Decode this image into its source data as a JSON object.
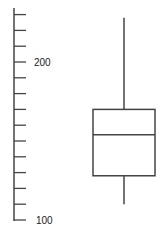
{
  "chart_data": {
    "type": "box",
    "title": "",
    "xlabel": "",
    "ylabel": "",
    "ylim": [
      100,
      230
    ],
    "y_ticks_labeled": [
      {
        "value": 100,
        "label": "100"
      },
      {
        "value": 200,
        "label": "200"
      }
    ],
    "y_minor_tick_step": 10,
    "y_ticks_all": [
      100,
      110,
      120,
      130,
      140,
      150,
      160,
      170,
      180,
      190,
      200,
      210,
      220,
      230
    ],
    "grid": false,
    "series": [
      {
        "name": "",
        "whisker_low": 110,
        "q1": 128,
        "median": 154,
        "q3": 170,
        "whisker_high": 228
      }
    ],
    "colors": {
      "stroke": "#444444",
      "fill": "#ffffff"
    }
  },
  "axis": {
    "label_200": "200",
    "label_100": "100"
  }
}
